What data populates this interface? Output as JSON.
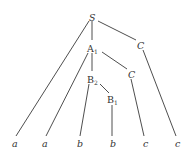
{
  "diagram": {
    "type": "parse-tree",
    "nodes": [
      {
        "id": "S",
        "label": "S",
        "italic": true,
        "x": 92,
        "y": 17
      },
      {
        "id": "A1",
        "label": "A",
        "sub": "1",
        "italic": false,
        "x": 92,
        "y": 48
      },
      {
        "id": "C_top",
        "label": "C",
        "italic": true,
        "x": 140,
        "y": 45
      },
      {
        "id": "B2",
        "label": "B",
        "sub": "2",
        "italic": false,
        "x": 92,
        "y": 79
      },
      {
        "id": "C_mid",
        "label": "C",
        "italic": true,
        "x": 131,
        "y": 74
      },
      {
        "id": "B1",
        "label": "B",
        "sub": "1",
        "italic": false,
        "x": 112,
        "y": 99
      },
      {
        "id": "leaf1",
        "label": "a",
        "italic": true,
        "x": 14,
        "y": 144
      },
      {
        "id": "leaf2",
        "label": "a",
        "italic": true,
        "x": 44,
        "y": 144
      },
      {
        "id": "leaf3",
        "label": "b",
        "italic": true,
        "x": 79,
        "y": 144
      },
      {
        "id": "leaf4",
        "label": "b",
        "italic": true,
        "x": 113,
        "y": 144
      },
      {
        "id": "leaf5",
        "label": "c",
        "italic": true,
        "x": 145,
        "y": 144
      },
      {
        "id": "leaf6",
        "label": "c",
        "italic": true,
        "x": 177,
        "y": 144
      }
    ],
    "edges": [
      {
        "from": "S",
        "to": "leaf1"
      },
      {
        "from": "S",
        "to": "A1"
      },
      {
        "from": "S",
        "to": "C_top"
      },
      {
        "from": "A1",
        "to": "leaf2"
      },
      {
        "from": "A1",
        "to": "B2"
      },
      {
        "from": "A1",
        "to": "C_mid"
      },
      {
        "from": "B2",
        "to": "leaf3"
      },
      {
        "from": "B2",
        "to": "B1"
      },
      {
        "from": "B1",
        "to": "leaf4"
      },
      {
        "from": "C_mid",
        "to": "leaf5"
      },
      {
        "from": "C_top",
        "to": "leaf6"
      }
    ]
  },
  "labels": {
    "S": "S",
    "A": "A",
    "A_sub": "1",
    "B2": "B",
    "B2_sub": "2",
    "B1": "B",
    "B1_sub": "1",
    "C_top": "C",
    "C_mid": "C",
    "leaf1": "a",
    "leaf2": "a",
    "leaf3": "b",
    "leaf4": "b",
    "leaf5": "c",
    "leaf6": "c"
  }
}
